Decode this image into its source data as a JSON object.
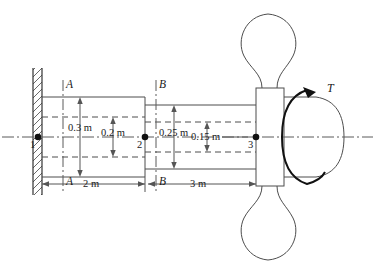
{
  "figure": {
    "background_color": "#ffffff",
    "line_color": "#4d4d4d",
    "accent_color": "#111111"
  },
  "nodes": [
    {
      "id": "node-1",
      "label": "1"
    },
    {
      "id": "node-2",
      "label": "2"
    },
    {
      "id": "node-3",
      "label": "3"
    }
  ],
  "section_labels": {
    "a_top": "A",
    "a_bottom": "A",
    "b_top": "B",
    "b_bottom": "B"
  },
  "diameter_dimensions": [
    {
      "id": "outer-left",
      "label": "0.3 m"
    },
    {
      "id": "inner-left",
      "label": "0.2 m"
    },
    {
      "id": "outer-right",
      "label": "0.25 m"
    },
    {
      "id": "inner-right",
      "label": "0.15 m"
    }
  ],
  "length_dimensions": [
    {
      "id": "segment-1-2",
      "label": "2 m"
    },
    {
      "id": "segment-2-3",
      "label": "3 m"
    }
  ],
  "load": {
    "symbol": "T",
    "description": "applied torque at free end"
  },
  "support": {
    "type": "fixed-wall",
    "hatching": true
  }
}
